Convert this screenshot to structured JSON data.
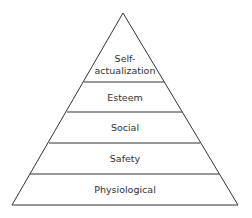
{
  "diagram": {
    "type": "pyramid",
    "levels": [
      {
        "label_lines": [
          "Self-",
          "actualization"
        ]
      },
      {
        "label": "Esteem"
      },
      {
        "label": "Social"
      },
      {
        "label": "Safety"
      },
      {
        "label": "Physiological"
      }
    ]
  }
}
